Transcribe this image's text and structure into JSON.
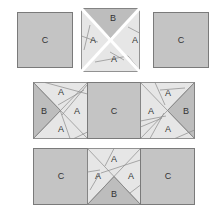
{
  "diagram": {
    "type": "quilt-block-assembly",
    "colors": {
      "c_fill": "#c4c4c4",
      "a_fill": "#e6e6e6",
      "b_fill": "#bdbdbd",
      "outline": "#7a7a7a"
    },
    "rows": [
      {
        "units": [
          {
            "kind": "solid",
            "label": "C"
          },
          {
            "kind": "pieced-separated",
            "labels": {
              "top": "B",
              "left": "A",
              "right": "A",
              "bottom": "A"
            }
          },
          {
            "kind": "solid",
            "label": "C"
          }
        ]
      },
      {
        "units": [
          {
            "kind": "pieced",
            "labels": {
              "left": "B",
              "top": "A",
              "right": "A",
              "bottom": "A"
            }
          },
          {
            "kind": "solid",
            "label": "C"
          },
          {
            "kind": "pieced",
            "labels": {
              "right": "B",
              "top": "A",
              "left": "A",
              "bottom": "A"
            }
          }
        ]
      },
      {
        "units": [
          {
            "kind": "solid",
            "label": "C"
          },
          {
            "kind": "pieced",
            "labels": {
              "bottom": "B",
              "top": "A",
              "left": "A",
              "right": "A"
            }
          },
          {
            "kind": "solid",
            "label": "C"
          }
        ]
      }
    ]
  }
}
